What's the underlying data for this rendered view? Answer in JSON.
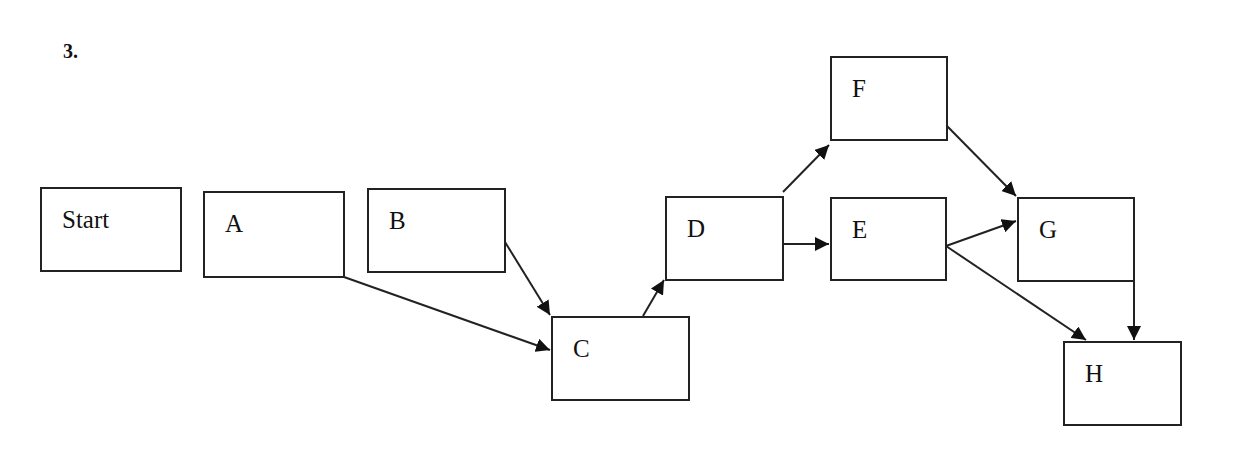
{
  "heading": "3.",
  "nodes": {
    "start": {
      "label": "Start"
    },
    "a": {
      "label": "A"
    },
    "b": {
      "label": "B"
    },
    "c": {
      "label": "C"
    },
    "d": {
      "label": "D"
    },
    "e": {
      "label": "E"
    },
    "f": {
      "label": "F"
    },
    "g": {
      "label": "G"
    },
    "h": {
      "label": "H"
    }
  },
  "edges": [
    {
      "from": "A",
      "to": "C"
    },
    {
      "from": "B",
      "to": "C"
    },
    {
      "from": "C",
      "to": "D"
    },
    {
      "from": "D",
      "to": "F"
    },
    {
      "from": "D",
      "to": "E"
    },
    {
      "from": "F",
      "to": "G"
    },
    {
      "from": "E",
      "to": "G"
    },
    {
      "from": "E",
      "to": "H"
    },
    {
      "from": "G",
      "to": "H"
    }
  ],
  "colors": {
    "stroke": "#222222",
    "background": "#ffffff"
  }
}
